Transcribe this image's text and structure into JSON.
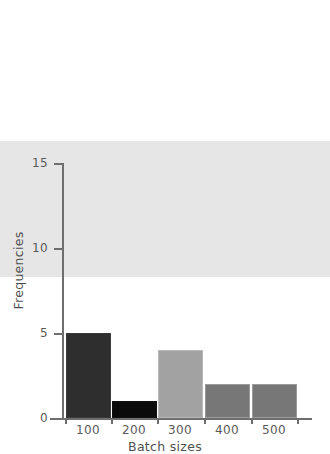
{
  "chart_data": {
    "type": "bar",
    "title": "",
    "categories": [
      "100",
      "200",
      "300",
      "400",
      "500"
    ],
    "values": [
      8,
      5,
      1,
      4,
      2
    ],
    "series": [
      {
        "name": "Frequencies",
        "values": [
          8,
          5,
          1,
          4,
          2
        ]
      }
    ],
    "xlabel": "Batch sizes",
    "ylabel": "Frequencies",
    "ylim": [
      0,
      15
    ],
    "yticks": [
      0,
      5,
      10,
      15
    ],
    "ytick_labels": [
      "0",
      "5",
      "10",
      "15"
    ],
    "xtick_labels": [
      "100",
      "200",
      "300",
      "400",
      "500"
    ],
    "grid": false,
    "legend": false,
    "bar_colors": [
      "#e6e6e6",
      "#2e2e2e",
      "#0b0b0b",
      "#a2a2a2",
      "#777777"
    ],
    "bar_border_colors": [
      "#8a8a8a",
      "#3a3a3a",
      "#111111",
      "#b9b9b9",
      "#9a9a9a"
    ],
    "axis_color": "#6e6e6e",
    "text_color": "#5a5a5a",
    "bars": [
      {
        "category": "100",
        "value": 8,
        "color": "#e6e6e6",
        "border": "#8a8a8a"
      },
      {
        "category": "200",
        "value": 5,
        "color": "#2e2e2e",
        "border": "#3a3a3a"
      },
      {
        "category": "300",
        "value": 1,
        "color": "#0b0b0b",
        "border": "#111111"
      },
      {
        "category": "400",
        "value": 4,
        "color": "#a2a2a2",
        "border": "#b9b9b9"
      },
      {
        "category": "500",
        "value": 2,
        "color": "#777777",
        "border": "#9a9a9a"
      }
    ]
  }
}
